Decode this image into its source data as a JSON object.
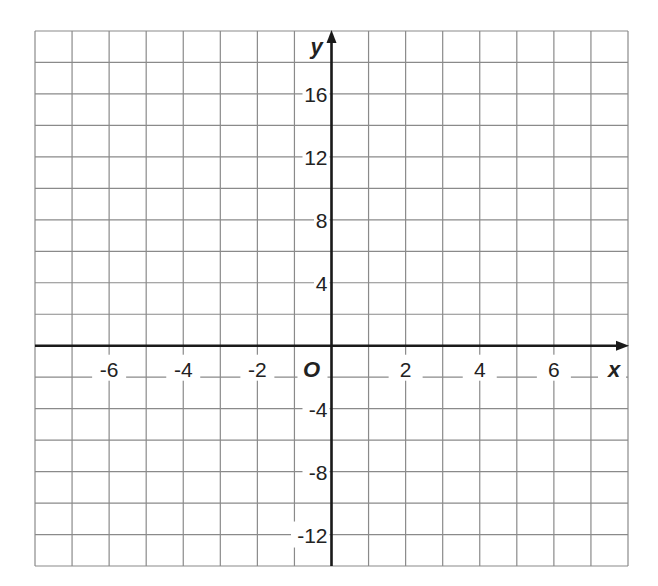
{
  "chart_data": {
    "type": "scatter",
    "title": "",
    "xlabel": "x",
    "ylabel": "y",
    "origin_label": "O",
    "grid": true,
    "x_ticks": [
      -6,
      -4,
      -2,
      2,
      4,
      6
    ],
    "y_ticks": [
      16,
      12,
      8,
      4,
      -4,
      -8,
      -12
    ],
    "x_tick_labels": [
      "-6",
      "-4",
      "-2",
      "2",
      "4",
      "6"
    ],
    "y_tick_labels": [
      "16",
      "12",
      "8",
      "4",
      "-4",
      "-8",
      "-12"
    ],
    "xlim": [
      -8,
      8
    ],
    "ylim": [
      -14,
      20
    ],
    "x_grid_step": 1,
    "y_grid_step": 2,
    "series": []
  },
  "colors": {
    "grid": "#8a8a8a",
    "axis": "#1a1a1a",
    "text": "#222222",
    "background": "#ffffff"
  }
}
